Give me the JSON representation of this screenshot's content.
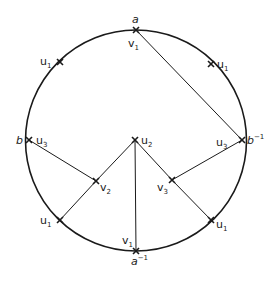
{
  "diagram": {
    "type": "circle-graph",
    "circle": {
      "cx": 136,
      "cy": 140.5,
      "r": 110.5,
      "stroke": "#1a1a1a"
    },
    "vertices": [
      {
        "id": "a",
        "x": 136,
        "y": 30,
        "on_circle": true
      },
      {
        "id": "a_inv",
        "x": 136,
        "y": 251,
        "on_circle": true
      },
      {
        "id": "b",
        "x": 29,
        "y": 140,
        "on_circle": true
      },
      {
        "id": "b_inv",
        "x": 242,
        "y": 140,
        "on_circle": true
      },
      {
        "id": "u1_ul",
        "x": 60,
        "y": 62,
        "on_circle": true
      },
      {
        "id": "u1_ur",
        "x": 211,
        "y": 64,
        "on_circle": true
      },
      {
        "id": "u1_ll",
        "x": 60,
        "y": 220,
        "on_circle": true
      },
      {
        "id": "u1_lr",
        "x": 211,
        "y": 220,
        "on_circle": true
      },
      {
        "id": "u2",
        "x": 135,
        "y": 140,
        "on_circle": false
      },
      {
        "id": "v2",
        "x": 96,
        "y": 181,
        "on_circle": false
      },
      {
        "id": "v3",
        "x": 172,
        "y": 180,
        "on_circle": false
      }
    ],
    "edges": [
      {
        "from": "a",
        "to": "b_inv"
      },
      {
        "from": "b",
        "to": "v2"
      },
      {
        "from": "v2",
        "to": "u2"
      },
      {
        "from": "v2",
        "to": "u1_ll"
      },
      {
        "from": "u2",
        "to": "a_inv"
      },
      {
        "from": "u2",
        "to": "v3"
      },
      {
        "from": "v3",
        "to": "u1_lr"
      },
      {
        "from": "v3",
        "to": "b_inv"
      }
    ],
    "labels": {
      "a": {
        "base": "a",
        "sup": ""
      },
      "v1_top": {
        "base": "v",
        "sub": "1"
      },
      "u1_ul": {
        "base": "u",
        "sub": "1"
      },
      "u1_ur": {
        "base": "u",
        "sub": "1"
      },
      "b": {
        "base": "b",
        "sup": ""
      },
      "u3_left": {
        "base": "u",
        "sub": "3"
      },
      "u2": {
        "base": "u",
        "sub": "2"
      },
      "u3_right": {
        "base": "u",
        "sub": "3"
      },
      "b_inv": {
        "base": "b",
        "sup": "−1"
      },
      "v2": {
        "base": "v",
        "sub": "2"
      },
      "v3": {
        "base": "v",
        "sub": "3"
      },
      "u1_ll": {
        "base": "u",
        "sub": "1"
      },
      "u1_lr": {
        "base": "u",
        "sub": "1"
      },
      "v1_bottom": {
        "base": "v",
        "sub": "1"
      },
      "a_inv": {
        "base": "a",
        "sup": "−1"
      }
    }
  }
}
